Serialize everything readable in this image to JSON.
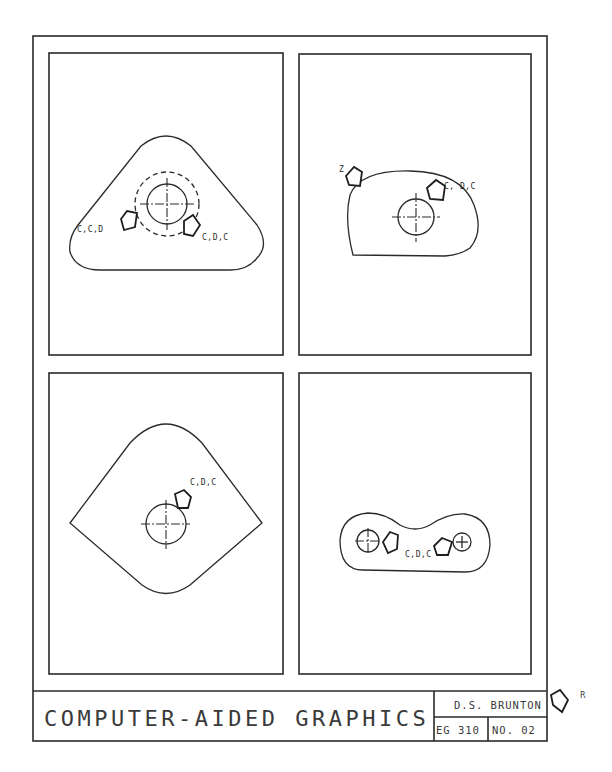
{
  "sheet": {
    "title": "COMPUTER-AIDED GRAPHICS",
    "author": "D.S. BRUNTON",
    "course": "EG 310",
    "number": "NO. 02",
    "rotation_marker": "R"
  },
  "panels": [
    {
      "id": "top-left",
      "shape": "rounded-triangle",
      "hole": "circle-with-dashed-bolt-circle",
      "labels": [
        "C,C,D",
        "C,D,C"
      ]
    },
    {
      "id": "top-right",
      "shape": "rounded-D-profile",
      "hole": "circle",
      "labels": [
        "Z",
        "C, D,C"
      ]
    },
    {
      "id": "bottom-left",
      "shape": "kite-with-rounded-top-bottom",
      "hole": "circle",
      "labels": [
        "C,D,C"
      ]
    },
    {
      "id": "bottom-right",
      "shape": "dogbone-link",
      "hole": "two-circles",
      "labels": [
        "C,D,C"
      ]
    }
  ],
  "colors": {
    "ink": "#2a2a2a",
    "paper": "#ffffff"
  }
}
